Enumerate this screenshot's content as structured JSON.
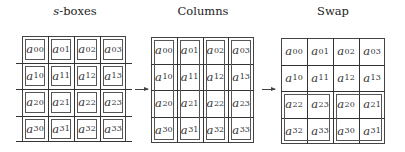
{
  "panels": [
    {
      "title_prefix": "s",
      "title_suffix": "-boxes",
      "grouping": "each cell individually boxed (s-box)",
      "cells": [
        [
          "a",
          "00",
          "a",
          "01",
          "a",
          "02",
          "a",
          "03"
        ],
        [
          "a",
          "10",
          "a",
          "11",
          "a",
          "12",
          "a",
          "13"
        ],
        [
          "a",
          "20",
          "a",
          "21",
          "a",
          "22",
          "a",
          "23"
        ],
        [
          "a",
          "30",
          "a",
          "31",
          "a",
          "32",
          "a",
          "33"
        ]
      ]
    },
    {
      "title": "Columns",
      "grouping": "each column boxed",
      "cells": [
        [
          "a",
          "00",
          "a",
          "01",
          "a",
          "02",
          "a",
          "03"
        ],
        [
          "a",
          "10",
          "a",
          "11",
          "a",
          "12",
          "a",
          "13"
        ],
        [
          "a",
          "20",
          "a",
          "21",
          "a",
          "22",
          "a",
          "23"
        ],
        [
          "a",
          "30",
          "a",
          "31",
          "a",
          "32",
          "a",
          "33"
        ]
      ]
    },
    {
      "title": "Swap",
      "grouping": "bottom-left and bottom-right 2x2 blocks boxed",
      "cells": [
        [
          "a",
          "00",
          "a",
          "01",
          "a",
          "02",
          "a",
          "03"
        ],
        [
          "a",
          "10",
          "a",
          "11",
          "a",
          "12",
          "a",
          "13"
        ],
        [
          "a",
          "22",
          "a",
          "23",
          "a",
          "20",
          "a",
          "21"
        ],
        [
          "a",
          "32",
          "a",
          "33",
          "a",
          "30",
          "a",
          "31"
        ]
      ]
    }
  ],
  "labels": {
    "p0": {
      "title": "s-boxes"
    },
    "p1": {
      "title": "Columns"
    },
    "p2": {
      "title": "Swap"
    }
  },
  "cells_text": {
    "p0": [
      [
        "00",
        "01",
        "02",
        "03"
      ],
      [
        "10",
        "11",
        "12",
        "13"
      ],
      [
        "20",
        "21",
        "22",
        "23"
      ],
      [
        "30",
        "31",
        "32",
        "33"
      ]
    ],
    "p1": [
      [
        "00",
        "01",
        "02",
        "03"
      ],
      [
        "10",
        "11",
        "12",
        "13"
      ],
      [
        "20",
        "21",
        "22",
        "23"
      ],
      [
        "30",
        "31",
        "32",
        "33"
      ]
    ],
    "p2": [
      [
        "00",
        "01",
        "02",
        "03"
      ],
      [
        "10",
        "11",
        "12",
        "13"
      ],
      [
        "22",
        "23",
        "20",
        "21"
      ],
      [
        "32",
        "33",
        "30",
        "31"
      ]
    ]
  },
  "variable": "a",
  "arrows": 2
}
